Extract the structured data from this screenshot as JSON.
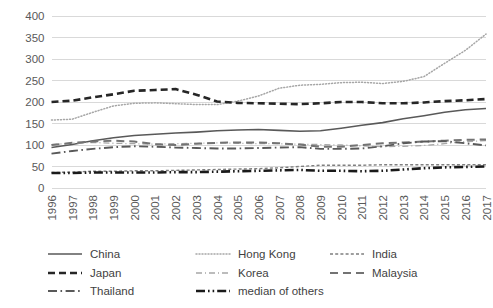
{
  "chart_data": {
    "type": "line",
    "title": "",
    "xlabel": "",
    "ylabel": "",
    "ylim": [
      0,
      400
    ],
    "ytick_step": 50,
    "yticks": [
      "0",
      "50",
      "100",
      "150",
      "200",
      "250",
      "300",
      "350",
      "400"
    ],
    "grid": true,
    "legend_position": "bottom",
    "categories": [
      "1996",
      "1997",
      "1998",
      "1999",
      "2000",
      "2001",
      "2002",
      "2003",
      "2004",
      "2005",
      "2006",
      "2007",
      "2008",
      "2009",
      "2010",
      "2011",
      "2012",
      "2013",
      "2014",
      "2015",
      "2016",
      "2017"
    ],
    "series": [
      {
        "name": "China",
        "style": "solid",
        "color": "#595959",
        "width": 1.6,
        "values": [
          94,
          101,
          110,
          117,
          122,
          125,
          128,
          130,
          133,
          135,
          136,
          134,
          132,
          133,
          139,
          146,
          152,
          161,
          168,
          176,
          182,
          185
        ]
      },
      {
        "name": "Hong Kong",
        "style": "dotted",
        "color": "#a6a6a6",
        "width": 1.5,
        "values": [
          158,
          160,
          176,
          191,
          197,
          198,
          196,
          194,
          194,
          202,
          214,
          232,
          239,
          241,
          245,
          246,
          243,
          248,
          259,
          290,
          320,
          358
        ]
      },
      {
        "name": "India",
        "style": "shortdash",
        "color": "#7f7f7f",
        "width": 1.4,
        "values": [
          36,
          37,
          39,
          39,
          40,
          40,
          41,
          42,
          43,
          44,
          45,
          47,
          50,
          53,
          53,
          53,
          54,
          54,
          54,
          54,
          54,
          54
        ]
      },
      {
        "name": "Japan",
        "style": "longdash",
        "color": "#262626",
        "width": 2.6,
        "values": [
          200,
          203,
          211,
          218,
          226,
          228,
          230,
          217,
          201,
          198,
          197,
          196,
          195,
          197,
          200,
          200,
          197,
          197,
          199,
          202,
          204,
          207
        ]
      },
      {
        "name": "Korea",
        "style": "dashdot-thin",
        "color": "#a6a6a6",
        "width": 1.3,
        "values": [
          101,
          104,
          106,
          104,
          103,
          102,
          103,
          104,
          105,
          104,
          103,
          103,
          102,
          101,
          100,
          98,
          96,
          97,
          99,
          103,
          108,
          110
        ]
      },
      {
        "name": "Malaysia",
        "style": "dash",
        "color": "#737373",
        "width": 2.0,
        "values": [
          100,
          105,
          108,
          110,
          108,
          102,
          100,
          103,
          105,
          106,
          106,
          104,
          101,
          96,
          96,
          100,
          104,
          106,
          108,
          110,
          112,
          113
        ]
      },
      {
        "name": "Thailand",
        "style": "dashdot",
        "color": "#595959",
        "width": 1.9,
        "values": [
          80,
          86,
          91,
          95,
          97,
          96,
          94,
          93,
          92,
          92,
          93,
          94,
          95,
          91,
          91,
          92,
          97,
          104,
          108,
          109,
          104,
          99
        ]
      },
      {
        "name": "median of others",
        "style": "dashdotdot-bold",
        "color": "#1a1a1a",
        "width": 2.6,
        "values": [
          35,
          35,
          36,
          36,
          36,
          36,
          37,
          37,
          38,
          39,
          40,
          41,
          42,
          40,
          40,
          39,
          40,
          43,
          46,
          48,
          49,
          50
        ]
      }
    ]
  },
  "legend": {
    "items": [
      {
        "label": "China"
      },
      {
        "label": "Hong Kong"
      },
      {
        "label": "India"
      },
      {
        "label": "Japan"
      },
      {
        "label": "Korea"
      },
      {
        "label": "Malaysia"
      },
      {
        "label": "Thailand"
      },
      {
        "label": "median of others"
      }
    ]
  }
}
